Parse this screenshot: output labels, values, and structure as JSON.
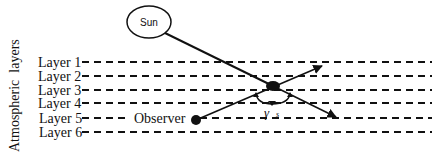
{
  "diagram": {
    "axis_label": "Atmospheric  layers",
    "sun_label": "Sun",
    "observer_label": "Observer",
    "angle_label_symbol": "γ",
    "angle_label_subscript": "s",
    "layers": [
      {
        "label": "Layer 1",
        "y": 62
      },
      {
        "label": "Layer 2",
        "y": 76
      },
      {
        "label": "Layer 3",
        "y": 90
      },
      {
        "label": "Layer 4",
        "y": 103
      },
      {
        "label": "Layer 5",
        "y": 118
      },
      {
        "label": "Layer 6",
        "y": 132
      }
    ],
    "colors": {
      "line": "#111111",
      "background": "#ffffff"
    }
  }
}
